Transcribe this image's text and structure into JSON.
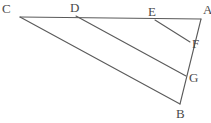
{
  "figure": {
    "type": "geometry-line-diagram",
    "canvas": {
      "width": 211,
      "height": 123,
      "background": "#ffffff"
    },
    "stroke_color": "#5a5a5a",
    "label_color": "#4a4a4a",
    "points": [
      {
        "id": "C",
        "label": "C",
        "x": 20,
        "y": 17,
        "label_x": 2,
        "label_y": 2
      },
      {
        "id": "D",
        "label": "D",
        "x": 76,
        "y": 16,
        "label_x": 70,
        "label_y": 1
      },
      {
        "id": "E",
        "label": "E",
        "x": 155,
        "y": 20,
        "label_x": 148,
        "label_y": 5
      },
      {
        "id": "A",
        "label": "A",
        "x": 201,
        "y": 19,
        "label_x": 203,
        "label_y": 3
      },
      {
        "id": "F",
        "label": "F",
        "x": 190,
        "y": 42,
        "label_x": 192,
        "label_y": 37
      },
      {
        "id": "G",
        "label": "G",
        "x": 186,
        "y": 76,
        "label_x": 189,
        "label_y": 71
      },
      {
        "id": "B",
        "label": "B",
        "x": 180,
        "y": 104,
        "label_x": 176,
        "label_y": 107
      }
    ],
    "segments": [
      {
        "id": "CA",
        "from": "C",
        "to": "A",
        "name": "segment-c-a"
      },
      {
        "id": "CB",
        "from": "C",
        "to": "B",
        "name": "segment-c-b"
      },
      {
        "id": "AB",
        "from": "A",
        "to": "B",
        "name": "segment-a-b"
      },
      {
        "id": "DG",
        "from": "D",
        "to": "G",
        "name": "segment-d-g"
      },
      {
        "id": "EF",
        "from": "E",
        "to": "F",
        "name": "segment-e-f"
      }
    ]
  }
}
